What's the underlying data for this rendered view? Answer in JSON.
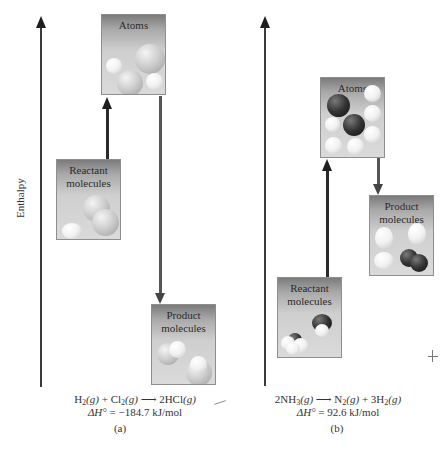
{
  "axis_label": "Enthalpy",
  "panels": [
    {
      "id": "a",
      "caption": "(a)",
      "boxes": {
        "atoms": "Atoms",
        "reactant": [
          "Reactant",
          "molecules"
        ],
        "product": [
          "Product",
          "molecules"
        ]
      },
      "equation": {
        "r1": "H",
        "r1_sub": "2",
        "r1_state": "(g)",
        "plus": " + ",
        "r2": "Cl",
        "r2_sub": "2",
        "r2_state": "(g)",
        "arrow": " ⟶ ",
        "p1": "2HCl",
        "p1_state": "(g)"
      },
      "delta_h": {
        "label": "ΔH°",
        "value": " = −184.7 kJ/mol"
      }
    },
    {
      "id": "b",
      "caption": "(b)",
      "boxes": {
        "atoms": "Atoms",
        "reactant": [
          "Reactant",
          "molecules"
        ],
        "product": [
          "Product",
          "molecules"
        ]
      },
      "equation": {
        "r1": "2NH",
        "r1_sub": "3",
        "r1_state": "(g)",
        "arrow": " ⟶ ",
        "p1": "N",
        "p1_sub": "2",
        "p1_state": "(g)",
        "plus": " + ",
        "p2": "3H",
        "p2_sub": "2",
        "p2_state": "(g)"
      },
      "delta_h": {
        "label": "ΔH°",
        "value": " = 92.6 kJ/mol"
      }
    }
  ]
}
